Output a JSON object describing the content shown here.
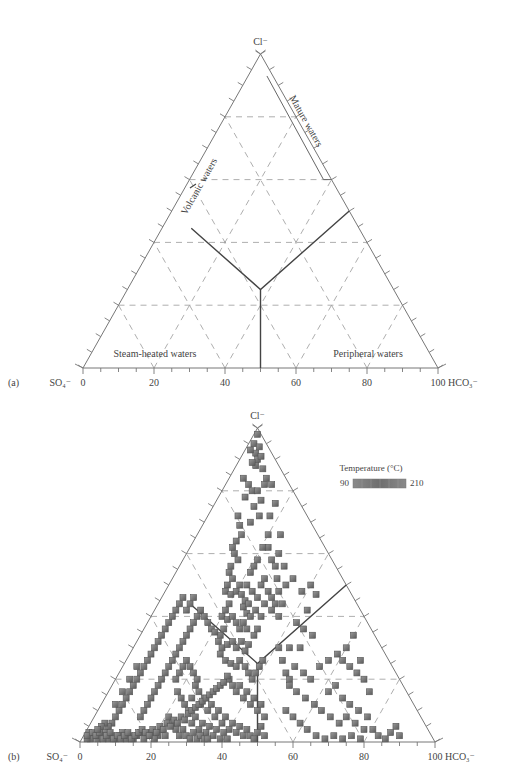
{
  "chart_data": [
    {
      "panel": "(a)",
      "type": "ternary",
      "apex_label": "Cl⁻",
      "left_label": "SO₄⁻",
      "right_label": "HCO₃⁻",
      "bottom_ticks": [
        "0",
        "20",
        "40",
        "60",
        "80",
        "100"
      ],
      "grid": "dashed every 20%",
      "regions": [
        "Mature waters",
        "Volcanic waters",
        "Steam-heated waters",
        "Peripheral waters"
      ],
      "boundaries": "Y-shaped divider meeting at center (~Cl 25%, axis 50) with vertical line to axis 50"
    },
    {
      "panel": "(b)",
      "type": "scatter",
      "apex_label": "Cl⁻",
      "left_label": "SO₄⁻",
      "right_label": "HCO₃⁻",
      "bottom_ticks": [
        "0",
        "20",
        "40",
        "60",
        "80",
        "100"
      ],
      "legend": {
        "title": "Temperature (°C)",
        "min": "90",
        "max": "210"
      },
      "points_u_cl": [
        [
          97,
          98
        ],
        [
          98,
          95
        ],
        [
          99,
          92
        ],
        [
          100,
          90
        ],
        [
          96,
          93
        ],
        [
          101,
          94
        ],
        [
          102,
          91
        ],
        [
          99,
          88
        ],
        [
          103,
          87
        ],
        [
          97,
          89
        ],
        [
          92,
          84
        ],
        [
          95,
          82
        ],
        [
          93,
          78
        ],
        [
          97,
          80
        ],
        [
          100,
          80
        ],
        [
          102,
          77
        ],
        [
          98,
          75
        ],
        [
          104,
          82
        ],
        [
          101,
          72
        ],
        [
          96,
          70
        ],
        [
          89,
          72
        ],
        [
          90,
          69
        ],
        [
          91,
          66
        ],
        [
          88,
          64
        ],
        [
          86,
          62
        ],
        [
          87,
          60
        ],
        [
          89,
          58
        ],
        [
          85,
          56
        ],
        [
          84,
          54
        ],
        [
          86,
          52
        ],
        [
          83,
          50
        ],
        [
          82,
          48
        ],
        [
          85,
          47
        ],
        [
          88,
          48
        ],
        [
          90,
          50
        ],
        [
          91,
          47
        ],
        [
          93,
          45
        ],
        [
          92,
          43
        ],
        [
          94,
          41
        ],
        [
          95,
          44
        ],
        [
          84,
          44
        ],
        [
          82,
          42
        ],
        [
          80,
          40
        ],
        [
          83,
          39
        ],
        [
          86,
          40
        ],
        [
          88,
          38
        ],
        [
          90,
          36
        ],
        [
          92,
          38
        ],
        [
          94,
          36
        ],
        [
          96,
          40
        ],
        [
          81,
          36
        ],
        [
          79,
          34
        ],
        [
          78,
          32
        ],
        [
          80,
          30
        ],
        [
          83,
          31
        ],
        [
          86,
          32
        ],
        [
          88,
          30
        ],
        [
          91,
          32
        ],
        [
          93,
          29
        ],
        [
          95,
          31
        ],
        [
          98,
          34
        ],
        [
          100,
          36
        ],
        [
          102,
          40
        ],
        [
          99,
          42
        ],
        [
          104,
          44
        ],
        [
          106,
          66
        ],
        [
          106,
          62
        ],
        [
          108,
          58
        ],
        [
          110,
          56
        ],
        [
          111,
          52
        ],
        [
          112,
          48
        ],
        [
          110,
          44
        ],
        [
          108,
          42
        ],
        [
          114,
          44
        ],
        [
          112,
          40
        ],
        [
          116,
          50
        ],
        [
          115,
          56
        ],
        [
          113,
          66
        ],
        [
          112,
          60
        ],
        [
          107,
          72
        ],
        [
          110,
          76
        ],
        [
          105,
          84
        ],
        [
          108,
          82
        ],
        [
          103,
          62
        ],
        [
          100,
          58
        ],
        [
          98,
          56
        ],
        [
          96,
          54
        ],
        [
          94,
          50
        ],
        [
          97,
          48
        ],
        [
          100,
          46
        ],
        [
          102,
          50
        ],
        [
          104,
          52
        ],
        [
          106,
          48
        ],
        [
          108,
          46
        ],
        [
          70,
          40
        ],
        [
          72,
          38
        ],
        [
          74,
          36
        ],
        [
          76,
          35
        ],
        [
          79,
          28
        ],
        [
          82,
          26
        ],
        [
          85,
          25
        ],
        [
          88,
          24
        ],
        [
          90,
          26
        ],
        [
          93,
          24
        ],
        [
          95,
          22
        ],
        [
          97,
          20
        ],
        [
          99,
          22
        ],
        [
          101,
          24
        ],
        [
          103,
          26
        ],
        [
          84,
          20
        ],
        [
          86,
          18
        ],
        [
          88,
          16
        ],
        [
          90,
          18
        ],
        [
          92,
          14
        ],
        [
          94,
          16
        ],
        [
          96,
          12
        ],
        [
          98,
          14
        ],
        [
          100,
          10
        ],
        [
          102,
          12
        ],
        [
          104,
          8
        ],
        [
          60,
          26
        ],
        [
          62,
          24
        ],
        [
          64,
          22
        ],
        [
          66,
          20
        ],
        [
          65,
          18
        ],
        [
          67,
          16
        ],
        [
          63,
          14
        ],
        [
          68,
          12
        ],
        [
          70,
          14
        ],
        [
          72,
          10
        ],
        [
          74,
          12
        ],
        [
          76,
          8
        ],
        [
          78,
          10
        ],
        [
          80,
          6
        ],
        [
          82,
          8
        ],
        [
          84,
          4
        ],
        [
          86,
          6
        ],
        [
          88,
          3
        ],
        [
          90,
          5
        ],
        [
          92,
          2
        ],
        [
          94,
          4
        ],
        [
          96,
          2
        ],
        [
          98,
          1
        ],
        [
          100,
          3
        ],
        [
          102,
          5
        ],
        [
          104,
          2
        ],
        [
          58,
          24
        ],
        [
          56,
          22
        ],
        [
          54,
          20
        ],
        [
          55,
          16
        ],
        [
          57,
          14
        ],
        [
          59,
          12
        ],
        [
          61,
          10
        ],
        [
          63,
          6
        ],
        [
          65,
          8
        ],
        [
          67,
          4
        ],
        [
          69,
          6
        ],
        [
          71,
          3
        ],
        [
          73,
          5
        ],
        [
          75,
          2
        ],
        [
          77,
          4
        ],
        [
          79,
          1
        ],
        [
          81,
          3
        ],
        [
          83,
          1
        ],
        [
          50,
          8
        ],
        [
          52,
          6
        ],
        [
          54,
          4
        ],
        [
          56,
          2
        ],
        [
          58,
          4
        ],
        [
          60,
          2
        ],
        [
          62,
          1
        ],
        [
          64,
          3
        ],
        [
          66,
          1
        ],
        [
          68,
          2
        ],
        [
          70,
          1
        ],
        [
          72,
          1
        ],
        [
          48,
          2
        ],
        [
          46,
          4
        ],
        [
          44,
          2
        ],
        [
          42,
          1
        ],
        [
          40,
          3
        ],
        [
          38,
          2
        ],
        [
          36,
          1
        ],
        [
          34,
          3
        ],
        [
          32,
          2
        ],
        [
          30,
          1
        ],
        [
          28,
          2
        ],
        [
          26,
          1
        ],
        [
          24,
          3
        ],
        [
          22,
          2
        ],
        [
          20,
          1
        ],
        [
          18,
          2
        ],
        [
          16,
          1
        ],
        [
          14,
          3
        ],
        [
          12,
          2
        ],
        [
          10,
          1
        ],
        [
          8,
          2
        ],
        [
          6,
          1
        ],
        [
          5,
          3
        ],
        [
          4,
          1
        ],
        [
          3,
          2
        ],
        [
          7,
          3
        ],
        [
          9,
          2
        ],
        [
          11,
          3
        ],
        [
          13,
          1
        ],
        [
          15,
          2
        ],
        [
          17,
          3
        ],
        [
          19,
          1
        ],
        [
          21,
          2
        ],
        [
          23,
          1
        ],
        [
          25,
          2
        ],
        [
          27,
          3
        ],
        [
          29,
          1
        ],
        [
          31,
          2
        ],
        [
          33,
          3
        ],
        [
          35,
          4
        ],
        [
          37,
          3
        ],
        [
          39,
          2
        ],
        [
          41,
          4
        ],
        [
          43,
          3
        ],
        [
          45,
          5
        ],
        [
          47,
          4
        ],
        [
          49,
          6
        ],
        [
          51,
          5
        ],
        [
          53,
          7
        ],
        [
          55,
          6
        ],
        [
          57,
          8
        ],
        [
          59,
          7
        ],
        [
          61,
          9
        ],
        [
          63,
          10
        ],
        [
          65,
          11
        ],
        [
          67,
          12
        ],
        [
          69,
          13
        ],
        [
          71,
          14
        ],
        [
          73,
          15
        ],
        [
          75,
          16
        ],
        [
          77,
          17
        ],
        [
          79,
          18
        ],
        [
          81,
          19
        ],
        [
          83,
          21
        ],
        [
          34,
          8
        ],
        [
          36,
          10
        ],
        [
          38,
          12
        ],
        [
          40,
          14
        ],
        [
          42,
          16
        ],
        [
          44,
          18
        ],
        [
          46,
          20
        ],
        [
          48,
          22
        ],
        [
          50,
          24
        ],
        [
          52,
          26
        ],
        [
          54,
          28
        ],
        [
          56,
          30
        ],
        [
          58,
          32
        ],
        [
          60,
          34
        ],
        [
          62,
          36
        ],
        [
          64,
          38
        ],
        [
          66,
          40
        ],
        [
          68,
          42
        ],
        [
          60,
          42
        ],
        [
          62,
          44
        ],
        [
          64,
          46
        ],
        [
          58,
          46
        ],
        [
          56,
          44
        ],
        [
          54,
          42
        ],
        [
          52,
          40
        ],
        [
          50,
          38
        ],
        [
          48,
          36
        ],
        [
          46,
          34
        ],
        [
          44,
          32
        ],
        [
          42,
          30
        ],
        [
          40,
          28
        ],
        [
          38,
          26
        ],
        [
          36,
          24
        ],
        [
          34,
          22
        ],
        [
          32,
          20
        ],
        [
          30,
          18
        ],
        [
          28,
          16
        ],
        [
          26,
          14
        ],
        [
          24,
          12
        ],
        [
          22,
          10
        ],
        [
          20,
          8
        ],
        [
          18,
          6
        ],
        [
          16,
          5
        ],
        [
          14,
          6
        ],
        [
          12,
          5
        ],
        [
          10,
          4
        ],
        [
          20,
          12
        ],
        [
          24,
          16
        ],
        [
          28,
          20
        ],
        [
          32,
          24
        ],
        [
          120,
          52
        ],
        [
          125,
          48
        ],
        [
          130,
          50
        ],
        [
          133,
          47
        ],
        [
          128,
          42
        ],
        [
          122,
          38
        ],
        [
          126,
          36
        ],
        [
          131,
          34
        ],
        [
          118,
          30
        ],
        [
          124,
          30
        ],
        [
          121,
          24
        ],
        [
          126,
          22
        ],
        [
          130,
          20
        ],
        [
          135,
          24
        ],
        [
          140,
          26
        ],
        [
          145,
          28
        ],
        [
          150,
          30
        ],
        [
          148,
          26
        ],
        [
          152,
          24
        ],
        [
          156,
          22
        ],
        [
          118,
          20
        ],
        [
          122,
          16
        ],
        [
          127,
          14
        ],
        [
          132,
          12
        ],
        [
          136,
          10
        ],
        [
          141,
          8
        ],
        [
          146,
          6
        ],
        [
          150,
          8
        ],
        [
          155,
          6
        ],
        [
          160,
          4
        ],
        [
          116,
          10
        ],
        [
          120,
          8
        ],
        [
          124,
          6
        ],
        [
          128,
          4
        ],
        [
          133,
          2
        ],
        [
          138,
          1
        ],
        [
          143,
          2
        ],
        [
          148,
          1
        ],
        [
          153,
          2
        ],
        [
          158,
          1
        ],
        [
          112,
          30
        ],
        [
          114,
          26
        ],
        [
          116,
          22
        ],
        [
          118,
          18
        ],
        [
          140,
          16
        ],
        [
          144,
          18
        ],
        [
          148,
          14
        ],
        [
          152,
          12
        ],
        [
          157,
          10
        ],
        [
          162,
          8
        ],
        [
          165,
          4
        ],
        [
          168,
          2
        ],
        [
          172,
          1
        ],
        [
          175,
          3
        ],
        [
          178,
          5
        ],
        [
          180,
          2
        ],
        [
          163,
          16
        ],
        [
          160,
          20
        ],
        [
          158,
          26
        ],
        [
          154,
          34
        ]
      ]
    }
  ]
}
